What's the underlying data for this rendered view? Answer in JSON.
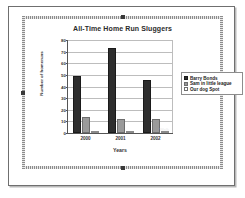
{
  "chart_data": {
    "type": "bar",
    "title": "All-Time Home Run Sluggers",
    "xlabel": "Years",
    "ylabel": "Number of homeruns",
    "categories": [
      "2000",
      "2001",
      "2002"
    ],
    "ylim": [
      0,
      80
    ],
    "yticks": [
      0,
      10,
      20,
      30,
      40,
      50,
      60,
      70,
      80
    ],
    "grid": true,
    "legend_position": "right",
    "series": [
      {
        "name": "Barry Bonds",
        "color": "#2e2e2e",
        "values": [
          49,
          73,
          46
        ]
      },
      {
        "name": "Sam in little league",
        "color": "#9a9a9a",
        "values": [
          14,
          12,
          12
        ]
      },
      {
        "name": "Our dog Spot",
        "color": "#ffffff",
        "values": [
          0,
          0,
          1
        ]
      }
    ],
    "annotations": [
      {
        "text": "Walk",
        "category": "2002",
        "series": "Our dog Spot"
      }
    ]
  },
  "legend": {
    "items": [
      {
        "label": "Barry Bonds"
      },
      {
        "label": "Sam in little league"
      },
      {
        "label": "Our dog Spot"
      }
    ]
  }
}
